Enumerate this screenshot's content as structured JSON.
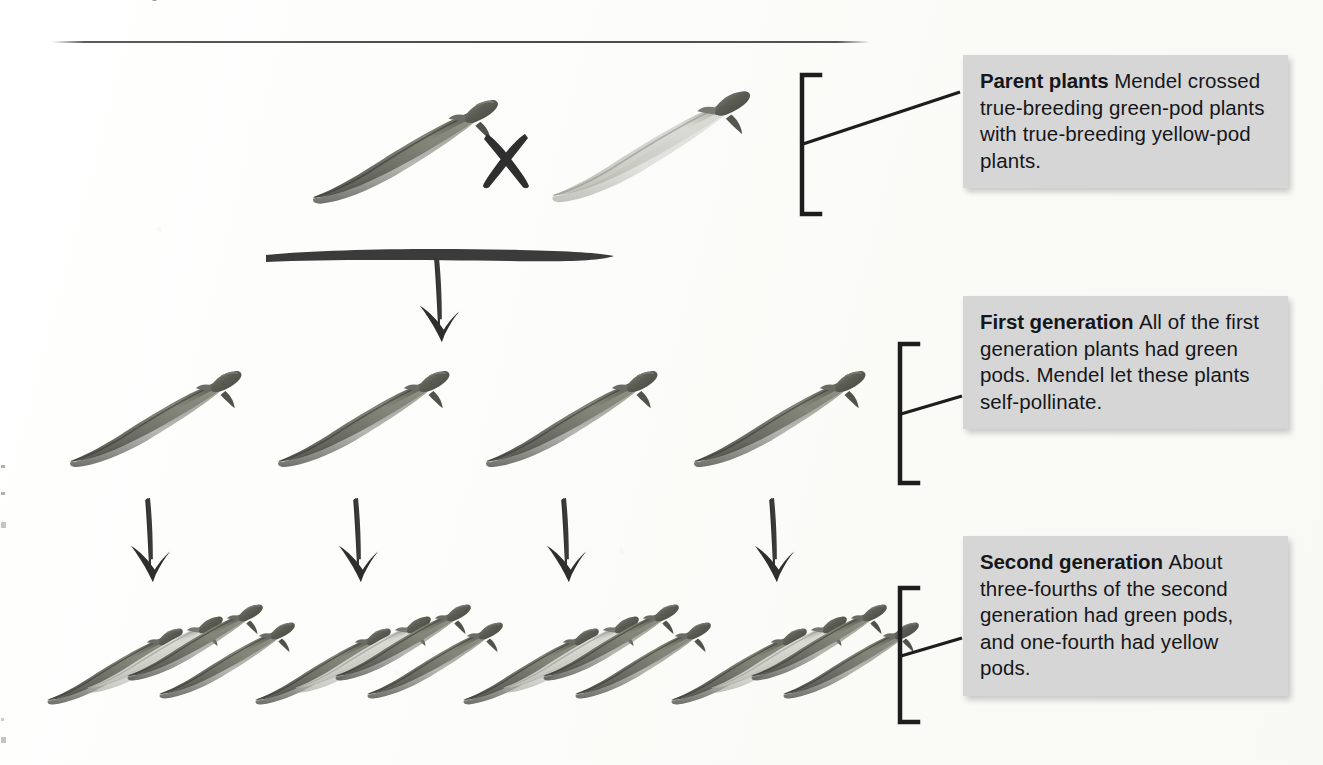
{
  "figure": {
    "kind": "genetics-cross-diagram",
    "background_color": "#fdfdfb",
    "caption_box_color": "#d6d6d6",
    "ink_color": "#2a2a2a"
  },
  "captions": [
    {
      "id": "parent-plants",
      "heading": "Parent plants",
      "body": "Mendel crossed true-breeding green-pod plants with true-breeding yellow-pod plants."
    },
    {
      "id": "first-generation",
      "heading": "First generation",
      "body": "All of the first generation plants had green pods. Mendel let these plants self-pollinate."
    },
    {
      "id": "second-generation",
      "heading": "Second generation",
      "body": "About three-fourths of the second generation had green pods, and one-fourth had yellow pods."
    }
  ],
  "rows": {
    "parents": {
      "label": "Parent plants",
      "cross_symbol": "×",
      "pods": [
        {
          "color": "green",
          "x": 300,
          "y": 95,
          "w": 200,
          "h": 115,
          "flip": false
        },
        {
          "color": "yellow",
          "x": 540,
          "y": 88,
          "w": 215,
          "h": 122,
          "flip": false
        }
      ]
    },
    "first_generation": {
      "label": "First generation",
      "pod_count": 4,
      "pods": [
        {
          "color": "green",
          "x": 60,
          "y": 368,
          "w": 185,
          "h": 105
        },
        {
          "color": "green",
          "x": 268,
          "y": 368,
          "w": 185,
          "h": 105
        },
        {
          "color": "green",
          "x": 476,
          "y": 368,
          "w": 185,
          "h": 105
        },
        {
          "color": "green",
          "x": 684,
          "y": 368,
          "w": 185,
          "h": 105
        }
      ]
    },
    "second_generation": {
      "label": "Second generation",
      "cluster_count": 4,
      "pods_per_cluster": 4,
      "cluster_pattern": [
        "green",
        "yellow",
        "green",
        "green"
      ],
      "clusters": [
        {
          "x": 45
        },
        {
          "x": 253
        },
        {
          "x": 461
        },
        {
          "x": 669
        }
      ]
    }
  },
  "arrows": {
    "cross_bar": {
      "x": 268,
      "y": 252,
      "width": 345,
      "thickness": 9
    },
    "cross_down_arrow": {
      "x": 438,
      "y": 258,
      "height": 75
    },
    "self_pollinate_arrows": [
      {
        "x": 148,
        "y": 500,
        "height": 80
      },
      {
        "x": 356,
        "y": 500,
        "height": 80
      },
      {
        "x": 564,
        "y": 500,
        "height": 80
      },
      {
        "x": 772,
        "y": 500,
        "height": 80
      }
    ]
  },
  "brackets": [
    {
      "id": "bracket-parents",
      "x": 800,
      "top": 75,
      "bottom": 214,
      "leader_to_y": 92
    },
    {
      "id": "bracket-first-gen",
      "x": 900,
      "top": 344,
      "bottom": 483,
      "leader_to_y": 392
    },
    {
      "id": "bracket-second-gen",
      "x": 900,
      "top": 588,
      "bottom": 722,
      "leader_to_y": 636
    }
  ],
  "pod_palette": {
    "green_dark": "#4d4f48",
    "green_mid": "#6f7167",
    "green_light": "#93958b",
    "yellow_light": "#c9c9c2",
    "yellow_mid": "#b3b4ab",
    "tip": "#55574f"
  }
}
